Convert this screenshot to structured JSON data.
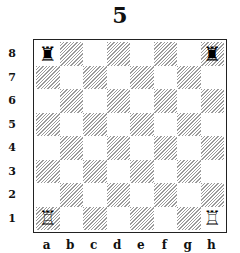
{
  "title": "5",
  "board": {
    "files": [
      "a",
      "b",
      "c",
      "d",
      "e",
      "f",
      "g",
      "h"
    ],
    "ranks": [
      "8",
      "7",
      "6",
      "5",
      "4",
      "3",
      "2",
      "1"
    ],
    "light_color": "#ffffff",
    "dark_pattern": "hatched-gray",
    "pieces": [
      {
        "square": "a8",
        "type": "rook",
        "color": "black",
        "glyph": "♜"
      },
      {
        "square": "h8",
        "type": "rook",
        "color": "black",
        "glyph": "♜"
      },
      {
        "square": "a1",
        "type": "rook",
        "color": "white",
        "glyph": "♖"
      },
      {
        "square": "h1",
        "type": "rook",
        "color": "white",
        "glyph": "♖"
      }
    ]
  }
}
